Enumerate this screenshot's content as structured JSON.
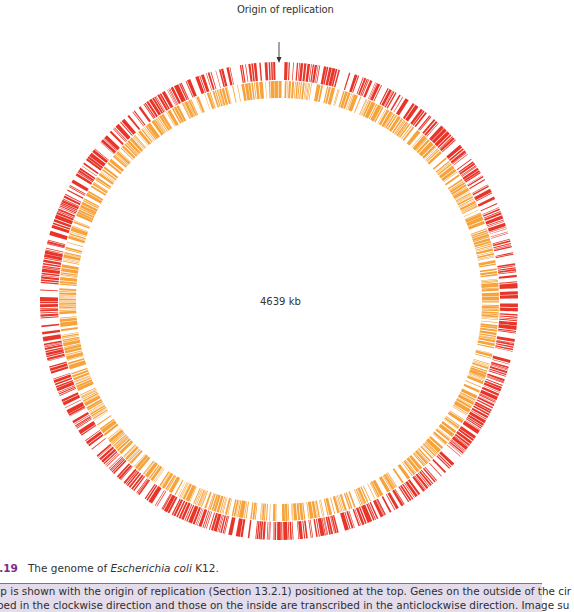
{
  "figure": {
    "number": "2.19",
    "title_prefix": "The genome of ",
    "title_species": "Escherichia coli",
    "title_suffix": " K12.",
    "caption_line1": "ap is shown with the origin of replication (Section 13.2.1) positioned at the top. Genes on the outside of the cir",
    "caption_line2": "ibed in the clockwise direction and those on the inside are transcribed in the anticlockwise direction. Image su"
  },
  "map": {
    "origin_label": "Origin of replication",
    "genome_size_label": "4639 kb",
    "center": [
      279,
      301
    ],
    "outer_ring": {
      "r_outer": 239,
      "r_inner": 221,
      "color": "#e8352a",
      "strand": "clockwise",
      "fill_fraction": 0.62
    },
    "inner_ring": {
      "r_outer": 220,
      "r_inner": 203,
      "color": "#f7a33c",
      "strand": "anticlockwise",
      "fill_fraction": 0.66
    },
    "arrow": {
      "x": 279,
      "y_start": 42,
      "y_end": 62,
      "color": "#333333"
    }
  },
  "chart_data": {
    "type": "circular-genome-map",
    "title": "The genome of Escherichia coli K12",
    "genome_size_kb": 4639,
    "annotations": [
      "Origin of replication (top, 0°)"
    ],
    "tracks": [
      {
        "name": "Genes transcribed clockwise",
        "position": "outer",
        "color": "#e8352a"
      },
      {
        "name": "Genes transcribed anticlockwise",
        "position": "inner",
        "color": "#f7a33c"
      }
    ]
  },
  "colors": {
    "accent_purple": "#7b2d84",
    "caption_bg": "#e4dcea"
  }
}
